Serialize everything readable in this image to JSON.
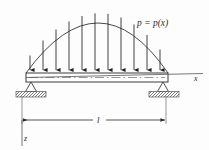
{
  "figure": {
    "type": "engineering-beam-diagram",
    "background_color": "#fdfdfd",
    "line_color": "#3a3a3a",
    "fill_color": "#ffffff"
  },
  "labels": {
    "load_function": "p = p(x)",
    "x_axis": "x",
    "z_axis": "z",
    "span": "l"
  },
  "beam": {
    "left_x": 26,
    "right_x": 168,
    "top_y": 73,
    "bottom_y": 82,
    "centerline_style": "dash-dot"
  },
  "load": {
    "shape": "parabola",
    "peak_x": 99,
    "peak_y": 13,
    "base_y": 73,
    "arrow_count": 11,
    "arrow_positions": [
      30,
      43,
      56,
      69,
      82,
      95,
      108,
      121,
      134,
      147,
      160
    ]
  },
  "supports": {
    "left": {
      "cx": 31,
      "type": "pin-triangle",
      "ground_y": 92
    },
    "right": {
      "cx": 163,
      "type": "pin-triangle",
      "ground_y": 92
    }
  },
  "dimension": {
    "y": 120,
    "from_x": 22,
    "to_x": 166,
    "label_x": 99
  },
  "axes": {
    "x_line_end": 203,
    "x_label_x": 196,
    "x_label_y": 82,
    "z_line_bottom": 146,
    "z_label_x": 24,
    "z_label_y": 140
  }
}
